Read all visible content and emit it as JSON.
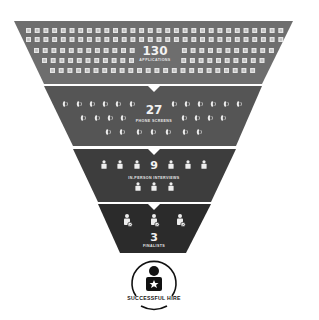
{
  "funnel": {
    "stages": [
      {
        "count": "130",
        "label": "APPLICATIONS",
        "icon": "document-icon",
        "color": "#6e6e6e"
      },
      {
        "count": "27",
        "label": "PHONE SCREENS",
        "icon": "phone-icon",
        "color": "#555555"
      },
      {
        "count": "9",
        "label": "IN-PERSON INTERVIEWS",
        "icon": "person-icon",
        "color": "#3d3d3d"
      },
      {
        "count": "3",
        "label": "FINALISTS",
        "icon": "person-check-icon",
        "color": "#2b2b2b"
      }
    ],
    "result": {
      "label": "SUCCESSFUL HIRE",
      "icon": "person-star-icon",
      "color": "#111111"
    }
  }
}
